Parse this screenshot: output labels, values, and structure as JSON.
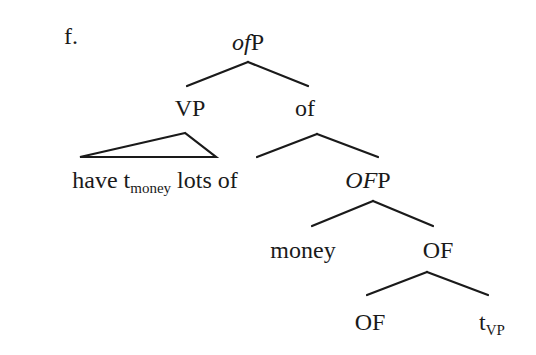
{
  "example_label": "f.",
  "tree": {
    "root": {
      "italic": "of",
      "rest": "P"
    },
    "vp": "VP",
    "of_bar": "of",
    "vp_yield": {
      "pre": "have t",
      "sub": "money",
      "post": " lots of"
    },
    "of_head": "of",
    "ofp": {
      "italic": "OF",
      "rest": "P"
    },
    "money": "money",
    "of_bar2": "OF",
    "of_head2": "OF",
    "trace": {
      "main": "t",
      "sub": "VP"
    }
  },
  "colors": {
    "ink": "#1a1a1a",
    "background": "#ffffff"
  }
}
